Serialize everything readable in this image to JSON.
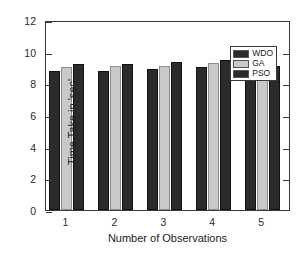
{
  "chart_data": {
    "type": "bar",
    "title": "",
    "xlabel": "Number of Observations",
    "ylabel": "Time Take in 'sec'",
    "categories": [
      "1",
      "2",
      "3",
      "4",
      "5"
    ],
    "series": [
      {
        "name": "WDO",
        "color": "#2b2b2b",
        "values": [
          8.9,
          8.85,
          9.0,
          9.1,
          8.95
        ]
      },
      {
        "name": "GA",
        "color": "#c9c9c9",
        "values": [
          9.1,
          9.2,
          9.2,
          9.4,
          9.4
        ]
      },
      {
        "name": "PSO",
        "color": "#2b2b2b",
        "values": [
          9.3,
          9.35,
          9.45,
          9.55,
          9.2
        ]
      }
    ],
    "ylim": [
      0,
      12
    ],
    "yticks": [
      "0",
      "2",
      "4",
      "6",
      "8",
      "10",
      "12"
    ],
    "xticks": [
      "1",
      "2",
      "3",
      "4",
      "5"
    ],
    "grid": false,
    "legend_position": "top-right",
    "legend_entries": [
      "WDO",
      "GA",
      "PSO"
    ],
    "axis_color": "#3a3a3a"
  }
}
